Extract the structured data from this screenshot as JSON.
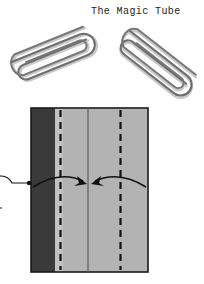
{
  "page": {
    "title": "The Magic Tube",
    "background_color": "#ffffff"
  },
  "photo": {
    "name": "paperclips-photo",
    "clips": [
      {
        "label": "paperclip-left",
        "rotation_deg": -22
      },
      {
        "label": "paperclip-right",
        "rotation_deg": 38
      }
    ],
    "wire_color": "#6e6e6e",
    "wire_shadow_color": "#9a9a9a"
  },
  "diagram": {
    "name": "fold-diagram",
    "paper": {
      "x": 31,
      "y": 108,
      "width": 117,
      "height": 164,
      "border_color": "#1a1a1a",
      "dark_band_color": "#3a3a3a",
      "mid_band_color": "#c2c2c2",
      "light_band_color": "#b3b3b3"
    },
    "bands": [
      {
        "name": "dark-band",
        "x": 31,
        "width": 24,
        "color": "#3a3a3a"
      },
      {
        "name": "mid-band",
        "x": 55,
        "width": 8,
        "color": "#c2c2c2"
      },
      {
        "name": "light-band",
        "x": 63,
        "width": 85,
        "color": "#b3b3b3"
      }
    ],
    "creases": [
      {
        "name": "valley-crease-left",
        "x": 60,
        "style": "dashed",
        "color": "#111111"
      },
      {
        "name": "center-line",
        "x": 88,
        "style": "solid",
        "color": "#555555"
      },
      {
        "name": "valley-crease-right",
        "x": 120,
        "style": "dashed",
        "color": "#111111"
      }
    ],
    "arrows": [
      {
        "name": "fold-arrow-left",
        "direction": "right",
        "from_x": 34,
        "to_x": 86,
        "y": 183
      },
      {
        "name": "fold-arrow-right",
        "direction": "left",
        "from_x": 146,
        "to_x": 90,
        "y": 183
      },
      {
        "name": "roll-behind-arrow",
        "direction": "loop",
        "x": 2,
        "y": 184
      }
    ]
  }
}
